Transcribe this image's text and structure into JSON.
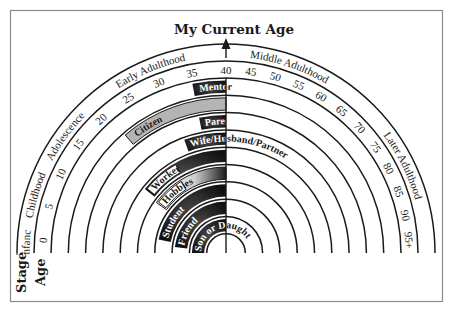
{
  "title": "My Current Age",
  "axis_labels": {
    "stage": "Stage",
    "age": "Age"
  },
  "stages": [
    {
      "label": "Infancy",
      "from": 0,
      "to": 3
    },
    {
      "label": "Childhood",
      "from": 3,
      "to": 12
    },
    {
      "label": "Adolescence",
      "from": 12,
      "to": 20
    },
    {
      "label": "Early Adulthood",
      "from": 20,
      "to": 40
    },
    {
      "label": "Middle Adulthood",
      "from": 40,
      "to": 65
    },
    {
      "label": "Later Adulthood",
      "from": 65,
      "to": 100
    }
  ],
  "ages": [
    "0",
    "5",
    "10",
    "15",
    "20",
    "25",
    "30",
    "35",
    "40",
    "45",
    "50",
    "55",
    "60",
    "65",
    "70",
    "75",
    "80",
    "85",
    "90",
    "95+"
  ],
  "current_age": 40,
  "roles": [
    {
      "label": "Mentor",
      "start_age": 35,
      "style": "dark"
    },
    {
      "label": "Citizen",
      "start_age": 22,
      "style": "gray"
    },
    {
      "label": "Parent",
      "start_age": 35,
      "style": "dark"
    },
    {
      "label": "Wife/Husband/Partner",
      "start_age": 31,
      "style": "dark"
    },
    {
      "label": "Worker",
      "start_age": 17,
      "style": "dark-tag"
    },
    {
      "label": "Hobbies",
      "start_age": 16,
      "style": "gradient-tag"
    },
    {
      "label": "Student",
      "start_age": 5,
      "style": "dark"
    },
    {
      "label": "Friend",
      "start_age": 3,
      "style": "dark"
    },
    {
      "label": "Son or Daughter",
      "start_age": 0,
      "style": "dark"
    }
  ],
  "colors": {
    "ink": "#1a1a1a",
    "dark_fill": "#1c1c1c",
    "gray_fill": "#b4b4b4",
    "frame": "#8a8a8a",
    "background": "#ffffff"
  }
}
